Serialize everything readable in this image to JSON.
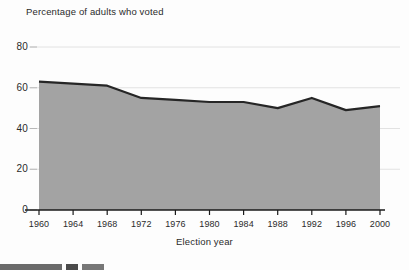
{
  "chart_data": {
    "type": "area",
    "title": "Percentage of adults who voted",
    "xlabel": "Election year",
    "ylabel": "",
    "categories": [
      1960,
      1964,
      1968,
      1972,
      1976,
      1980,
      1984,
      1988,
      1992,
      1996,
      2000
    ],
    "x_tick_labels": [
      "1960",
      "1964",
      "1968",
      "1972",
      "1976",
      "1980",
      "1984",
      "1988",
      "1992",
      "1996",
      "2000"
    ],
    "y_tick_labels": [
      "0",
      "20",
      "40",
      "60",
      "80"
    ],
    "y_ticks": [
      0,
      20,
      40,
      60,
      80
    ],
    "ylim": [
      0,
      80
    ],
    "xlim": [
      1960,
      2000
    ],
    "grid": true,
    "legend": "none",
    "series": [
      {
        "name": "Percentage of adults who voted",
        "values": [
          63,
          62,
          61,
          55,
          54,
          53,
          53,
          50,
          55,
          49,
          51
        ]
      }
    ],
    "fill_color": "#a3a3a3",
    "line_color": "#262626",
    "grid_color": "#e2e2e2",
    "axis_color": "#1a1a1a"
  },
  "footer": {
    "bar1": "",
    "bar2": "",
    "bar3": ""
  }
}
